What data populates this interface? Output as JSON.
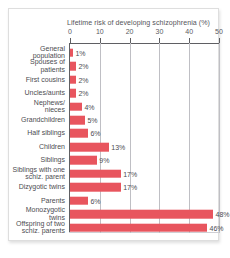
{
  "figure": {
    "title": "Lifetime risk of  developing schizophrenia (%)",
    "bar_color": "#e8555e",
    "axis_color": "#5f5f63",
    "grid_color": "#bfbfc4",
    "background": "#ffffff"
  },
  "chart_data": {
    "type": "bar",
    "orientation": "horizontal",
    "title": "Lifetime risk of  developing schizophrenia (%)",
    "xlabel": "",
    "ylabel": "",
    "xlim": [
      0,
      50
    ],
    "xticks": [
      0,
      10,
      20,
      30,
      40,
      50
    ],
    "xtick_labels": [
      "0",
      "10",
      "20",
      "30",
      "40",
      "50"
    ],
    "grid": true,
    "legend": null,
    "value_suffix": "%",
    "categories": [
      "General\npopulation",
      "Spouses of\npatients",
      "First cousins",
      "Uncles/aunts",
      "Nephews/\nnieces",
      "Grandchildren",
      "Half siblings",
      "Children",
      "Siblings",
      "Siblings with one\nschiz. parent",
      "Dizygotic twins",
      "Parents",
      "Monozygotic\ntwins",
      "Offspring of two\nschiz. parents"
    ],
    "values": [
      1,
      2,
      2,
      2,
      4,
      5,
      6,
      13,
      9,
      17,
      17,
      6,
      48,
      46
    ],
    "value_labels": [
      "1%",
      "2%",
      "2%",
      "2%",
      "4%",
      "5%",
      "6%",
      "13%",
      "9%",
      "17%",
      "17%",
      "6%",
      "48%",
      "46%"
    ]
  }
}
